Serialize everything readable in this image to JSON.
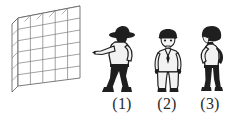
{
  "scene": {
    "background_color": "#ffffff",
    "ink_color": "#2b2b2b",
    "description": "Line-drawn perspective wall at left with three silhouette human figures at right labelled (1), (2), (3)"
  },
  "wall": {
    "name": "perspective-grid-wall",
    "rows": 6,
    "columns": 5,
    "line_color": "#595959",
    "face_color": "#ffffff",
    "orientation": "receding-to-upper-right"
  },
  "figures": [
    {
      "id": "figure-1",
      "label": "(1)",
      "pose": "pointing-left-with-extended-arm",
      "headwear": "wide-brim-hat",
      "attire": "light-shirt-dark-trousers",
      "facing": "left-profile"
    },
    {
      "id": "figure-2",
      "label": "(2)",
      "pose": "standing-facing-viewer-arms-at-sides",
      "headwear": "dark-cap",
      "attire": "light-suit",
      "facing": "front"
    },
    {
      "id": "figure-3",
      "label": "(3)",
      "pose": "standing-profile-hands-on-hips",
      "headwear": "dark-hair-or-cap",
      "attire": "light-top-dark-trousers",
      "facing": "right-profile"
    }
  ],
  "labels": {
    "items": [
      {
        "text": "(1)",
        "for": "figure-1"
      },
      {
        "text": "(2)",
        "for": "figure-2"
      },
      {
        "text": "(3)",
        "for": "figure-3"
      }
    ]
  }
}
